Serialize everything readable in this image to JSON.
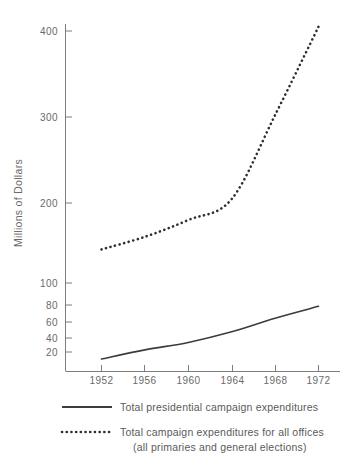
{
  "chart_data": {
    "type": "line",
    "title": "",
    "xlabel": "",
    "ylabel": "Millions of Dollars",
    "x": [
      1952,
      1956,
      1960,
      1964,
      1968,
      1972
    ],
    "xticklabels": [
      "1952",
      "1956",
      "1960",
      "1964",
      "1968",
      "1972"
    ],
    "yticklabels": [
      "20",
      "40",
      "60",
      "80",
      "100",
      "200",
      "300",
      "400"
    ],
    "ytickvalues": [
      20,
      40,
      60,
      80,
      100,
      200,
      300,
      400
    ],
    "ylim": [
      14,
      430
    ],
    "yscale": "broken (logarithmic below 100, linear above 100)",
    "xlim": [
      1950,
      1974
    ],
    "grid": false,
    "legend_position": "below",
    "series": [
      {
        "name": "Total presidential campaign expenditures",
        "style": "solid",
        "color": "#3c3c3c",
        "values": [
          17,
          21,
          25,
          32,
          44,
          58
        ]
      },
      {
        "name": "Total campaign expenditures for all offices (all primaries and general elections)",
        "style": "dotted",
        "color": "#2e2e2e",
        "values": [
          140,
          155,
          175,
          200,
          300,
          405
        ]
      }
    ]
  },
  "axes": {
    "y_title": "Millions of Dollars",
    "y_ticks": [
      "400",
      "300",
      "200",
      "100",
      "80",
      "60",
      "40",
      "20"
    ],
    "x_ticks": [
      "1952",
      "1956",
      "1960",
      "1964",
      "1968",
      "1972"
    ]
  },
  "legend": {
    "entries": [
      {
        "marker": "solid-line",
        "line1": "Total presidential campaign expenditures",
        "line2": ""
      },
      {
        "marker": "dotted-line",
        "line1": "Total campaign expenditures for all offices",
        "line2": "(all primaries and general elections)"
      }
    ]
  }
}
